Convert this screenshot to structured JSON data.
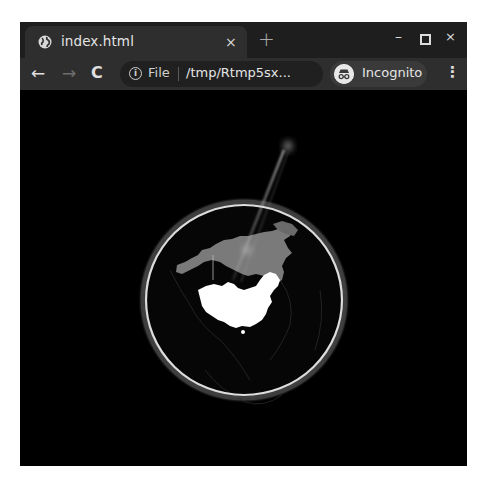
{
  "browser": {
    "tab": {
      "title": "index.html",
      "icon": "globe-icon",
      "close_label": "×"
    },
    "new_tab_label": "+",
    "window_controls": {
      "minimize": "–",
      "maximize": "□",
      "close": "×"
    },
    "toolbar": {
      "back_icon": "←",
      "forward_icon": "→",
      "reload_icon": "C",
      "info_icon": "i",
      "scheme_label": "File",
      "url": "/tmp/Rtmp5sx...",
      "bookmark_icon": "☆",
      "profile_label": "Incognito",
      "menu_icon": "⋮"
    }
  },
  "page": {
    "visualization": "3D globe",
    "highlighted_country": "China",
    "secondary_region": "Russia",
    "colors": {
      "background": "#000000",
      "globe_ring": "#e8e8e8",
      "highlighted_country": "#ffffff",
      "secondary_region": "#7d7d7d",
      "beam": "#cfcfcf"
    }
  }
}
